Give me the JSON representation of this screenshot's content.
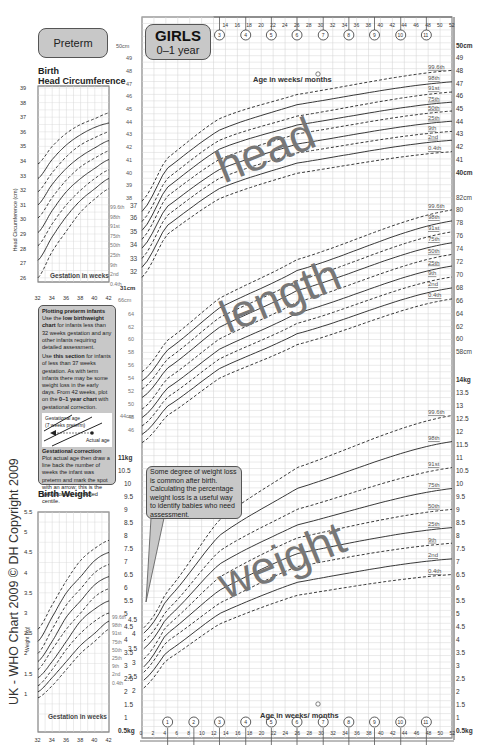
{
  "header": {
    "preterm_label": "Preterm",
    "girls_title": "GIRLS",
    "girls_subtitle": "0–1 year"
  },
  "preterm_head": {
    "title_line1": "Birth",
    "title_line2": "Head Circumference",
    "ylabel": "Head Circumference (cm)",
    "xlabel": "Gestation in weeks",
    "yticks": [
      "39",
      "38",
      "37",
      "36",
      "35",
      "34",
      "33",
      "32",
      "31",
      "30",
      "29",
      "28",
      "27",
      "26"
    ],
    "xticks": [
      "32",
      "34",
      "36",
      "38",
      "40",
      "42"
    ]
  },
  "preterm_weight": {
    "title": "Birth Weight",
    "ylabel": "Weight (kg)",
    "xlabel": "Gestation in weeks",
    "yticks": [
      "5.5",
      "5",
      "4.5",
      "4",
      "3.5",
      "3",
      "2.5",
      "2",
      "1.5",
      "1"
    ],
    "xticks": [
      "32",
      "34",
      "36",
      "38",
      "40",
      "42"
    ]
  },
  "info_box": {
    "p1_title": "Plotting preterm infants",
    "p1_a": "Use the ",
    "p1_b": "low birthweight chart",
    "p1_c": " for infants less than 32 weeks gestation and any other infants requiring detailed assessment.",
    "p2_a": "Use ",
    "p2_b": "this section",
    "p2_c": " for infants of less than 37 weeks gestation. As with term infants there may be some weight loss in the early days. From 42 weeks, plot on the ",
    "p2_d": "0–1 year chart",
    "p2_e": " with gestational correction.",
    "diagram_label1": "Gestational age",
    "diagram_label2": "(7 weeks preterm)",
    "diagram_label3": "Actual age",
    "p3_title": "Gestational correction",
    "p3_text": "Plot actual age then draw a line back the number of weeks the infant was preterm and mark the spot with an arrow; this is the gestationally corrected centile."
  },
  "callout": {
    "text": "Some degree of weight loss is common after birth. Calculating the percentage weight loss is a useful way to identify babies who need assessment."
  },
  "axis": {
    "age_label": "Age in weeks/ months",
    "weeks_top": [
      "14",
      "16",
      "18",
      "20",
      "22",
      "24",
      "26",
      "28",
      "30",
      "32",
      "34",
      "36",
      "38",
      "40",
      "42",
      "44",
      "46",
      "48",
      "50",
      "52"
    ],
    "weeks_bottom": [
      "0",
      "2",
      "4",
      "6",
      "8",
      "10",
      "12",
      "14",
      "16",
      "18",
      "20",
      "22",
      "24",
      "26",
      "28",
      "30",
      "32",
      "34",
      "36",
      "38",
      "40",
      "42",
      "44",
      "46",
      "48",
      "50",
      "52"
    ],
    "months_top": [
      "3",
      "4",
      "5",
      "6",
      "7",
      "8",
      "9",
      "10",
      "11"
    ],
    "months_bottom": [
      "1",
      "2",
      "3",
      "4",
      "5",
      "6",
      "7",
      "8",
      "9",
      "10",
      "11"
    ]
  },
  "centile_labels": [
    "99.6th",
    "98th",
    "91st",
    "75th",
    "50th",
    "25th",
    "9th",
    "2nd",
    "0.4th"
  ],
  "section_labels": {
    "head": "head",
    "length": "length",
    "weight": "weight"
  },
  "copyright": "UK - WHO Chart 2009   © DH Copyright 2009",
  "colors": {
    "panel": "#c8c8c8",
    "grid": "#d6d6d6",
    "curve": "#222222",
    "watermark": "#777777"
  },
  "chart_data": [
    {
      "type": "line",
      "title": "Head circumference, Girls 0–1 year",
      "xlabel": "Age in weeks",
      "ylabel": "cm",
      "xlim": [
        0,
        52
      ],
      "ylim": [
        31,
        50
      ],
      "x": [
        0,
        4,
        13,
        26,
        52
      ],
      "series": [
        {
          "name": "99.6th",
          "values": [
            37.7,
            41.0,
            44.2,
            46.1,
            48.0
          ]
        },
        {
          "name": "98th",
          "values": [
            36.9,
            40.2,
            43.3,
            45.3,
            47.1
          ]
        },
        {
          "name": "91st",
          "values": [
            36.1,
            39.4,
            42.5,
            44.4,
            46.3
          ]
        },
        {
          "name": "75th",
          "values": [
            35.4,
            38.7,
            41.8,
            43.7,
            45.5
          ]
        },
        {
          "name": "50th",
          "values": [
            34.7,
            38.0,
            41.0,
            43.0,
            44.8
          ]
        },
        {
          "name": "25th",
          "values": [
            34.0,
            37.2,
            40.2,
            42.2,
            44.0
          ]
        },
        {
          "name": "9th",
          "values": [
            33.2,
            36.5,
            39.5,
            41.5,
            43.2
          ]
        },
        {
          "name": "2nd",
          "values": [
            32.5,
            35.7,
            38.7,
            40.7,
            42.5
          ]
        },
        {
          "name": "0.4th",
          "values": [
            31.7,
            35.0,
            37.9,
            39.9,
            41.6
          ]
        }
      ],
      "yticks_right": [
        "50cm",
        "49",
        "48",
        "47",
        "46",
        "45",
        "44",
        "43",
        "42",
        "41",
        "40cm"
      ]
    },
    {
      "type": "line",
      "title": "Length, Girls 0–1 year",
      "xlabel": "Age in weeks",
      "ylabel": "cm",
      "xlim": [
        0,
        52
      ],
      "ylim": [
        44,
        82
      ],
      "x": [
        0,
        4,
        13,
        26,
        52
      ],
      "series": [
        {
          "name": "99.6th",
          "values": [
            54.9,
            59.6,
            66.3,
            72.3,
            80.0
          ]
        },
        {
          "name": "98th",
          "values": [
            53.5,
            58.1,
            64.8,
            70.6,
            78.3
          ]
        },
        {
          "name": "91st",
          "values": [
            52.2,
            56.7,
            63.3,
            69.0,
            76.6
          ]
        },
        {
          "name": "75th",
          "values": [
            50.9,
            55.3,
            61.8,
            67.5,
            74.9
          ]
        },
        {
          "name": "50th",
          "values": [
            49.1,
            53.7,
            60.0,
            65.7,
            73.1
          ]
        },
        {
          "name": "25th",
          "values": [
            47.8,
            52.2,
            58.4,
            64.0,
            71.3
          ]
        },
        {
          "name": "9th",
          "values": [
            46.5,
            50.8,
            56.9,
            62.4,
            69.6
          ]
        },
        {
          "name": "2nd",
          "values": [
            45.2,
            49.4,
            55.4,
            60.8,
            67.9
          ]
        },
        {
          "name": "0.4th",
          "values": [
            43.9,
            48.0,
            53.9,
            59.1,
            66.2
          ]
        }
      ],
      "yticks_right": [
        "82cm",
        "80",
        "78",
        "76",
        "74",
        "72",
        "70",
        "68",
        "66",
        "64",
        "62",
        "60",
        "58cm"
      ]
    },
    {
      "type": "line",
      "title": "Weight, Girls 0–1 year",
      "xlabel": "Age in weeks",
      "ylabel": "kg",
      "xlim": [
        0,
        52
      ],
      "ylim": [
        0.5,
        14
      ],
      "x": [
        0,
        4,
        13,
        26,
        52
      ],
      "series": [
        {
          "name": "99.6th",
          "values": [
            4.4,
            5.8,
            8.6,
            10.6,
            12.6
          ]
        },
        {
          "name": "98th",
          "values": [
            4.2,
            5.5,
            8.0,
            9.8,
            11.6
          ]
        },
        {
          "name": "91st",
          "values": [
            3.9,
            5.1,
            7.4,
            9.0,
            10.6
          ]
        },
        {
          "name": "75th",
          "values": [
            3.6,
            4.8,
            6.9,
            8.4,
            9.8
          ]
        },
        {
          "name": "50th",
          "values": [
            3.2,
            4.5,
            6.4,
            7.9,
            9.0
          ]
        },
        {
          "name": "25th",
          "values": [
            2.9,
            4.2,
            5.9,
            7.3,
            8.3
          ]
        },
        {
          "name": "9th",
          "values": [
            2.7,
            3.9,
            5.4,
            6.8,
            7.7
          ]
        },
        {
          "name": "2nd",
          "values": [
            2.4,
            3.5,
            5.0,
            6.2,
            7.1
          ]
        },
        {
          "name": "0.4th",
          "values": [
            2.1,
            3.2,
            4.6,
            5.7,
            6.5
          ]
        }
      ],
      "yticks_right": [
        "14kg",
        "13.5",
        "13",
        "12.5",
        "12",
        "11.5",
        "11",
        "10.5",
        "10",
        "9.5",
        "9",
        "8.5",
        "8",
        "7.5",
        "7",
        "6.5",
        "6",
        "5.5",
        "5",
        "4.5",
        "4",
        "3.5",
        "3",
        "2.5",
        "2",
        "1.5",
        "1",
        "0.5kg"
      ]
    },
    {
      "type": "line",
      "title": "Preterm Birth Head Circumference",
      "xlabel": "Gestation in weeks",
      "ylabel": "Head Circumference (cm)",
      "xlim": [
        32,
        42
      ],
      "ylim": [
        25.5,
        39
      ],
      "x": [
        32,
        34,
        36,
        38,
        40,
        42
      ],
      "series": [
        {
          "name": "99.6th",
          "values": [
            33.8,
            35.0,
            35.9,
            36.5,
            36.9,
            37.3
          ]
        },
        {
          "name": "98th",
          "values": [
            32.8,
            34.1,
            35.1,
            35.8,
            36.3,
            36.6
          ]
        },
        {
          "name": "91st",
          "values": [
            31.9,
            33.2,
            34.3,
            35.1,
            35.6,
            36.0
          ]
        },
        {
          "name": "75th",
          "values": [
            31.0,
            32.4,
            33.5,
            34.3,
            34.9,
            35.4
          ]
        },
        {
          "name": "50th",
          "values": [
            30.1,
            31.5,
            32.7,
            33.6,
            34.2,
            34.7
          ]
        },
        {
          "name": "25th",
          "values": [
            29.1,
            30.6,
            31.9,
            32.8,
            33.5,
            34.1
          ]
        },
        {
          "name": "9th",
          "values": [
            28.2,
            29.7,
            31.0,
            32.0,
            32.8,
            33.4
          ]
        },
        {
          "name": "2nd",
          "values": [
            27.2,
            28.8,
            30.2,
            31.3,
            32.1,
            32.8
          ]
        },
        {
          "name": "0.4th",
          "values": [
            26.0,
            27.8,
            29.2,
            30.5,
            31.4,
            32.1
          ]
        }
      ]
    },
    {
      "type": "line",
      "title": "Preterm Birth Weight",
      "xlabel": "Gestation in weeks",
      "ylabel": "Weight (kg)",
      "xlim": [
        32,
        42
      ],
      "ylim": [
        0.5,
        5.5
      ],
      "x": [
        32,
        34,
        36,
        38,
        40,
        42
      ],
      "series": [
        {
          "name": "99.6th",
          "values": [
            2.6,
            3.2,
            3.8,
            4.3,
            4.6,
            4.8
          ]
        },
        {
          "name": "98th",
          "values": [
            2.3,
            2.9,
            3.5,
            3.9,
            4.3,
            4.5
          ]
        },
        {
          "name": "91st",
          "values": [
            2.0,
            2.6,
            3.2,
            3.6,
            4.0,
            4.2
          ]
        },
        {
          "name": "75th",
          "values": [
            1.8,
            2.3,
            2.9,
            3.3,
            3.7,
            3.9
          ]
        },
        {
          "name": "50th",
          "values": [
            1.6,
            2.1,
            2.6,
            3.0,
            3.4,
            3.6
          ]
        },
        {
          "name": "25th",
          "values": [
            1.4,
            1.8,
            2.3,
            2.8,
            3.1,
            3.3
          ]
        },
        {
          "name": "9th",
          "values": [
            1.2,
            1.6,
            2.1,
            2.5,
            2.8,
            3.0
          ]
        },
        {
          "name": "2nd",
          "values": [
            1.05,
            1.4,
            1.8,
            2.2,
            2.5,
            2.8
          ]
        },
        {
          "name": "0.4th",
          "values": [
            0.9,
            1.2,
            1.6,
            2.0,
            2.3,
            2.6
          ]
        }
      ]
    }
  ]
}
